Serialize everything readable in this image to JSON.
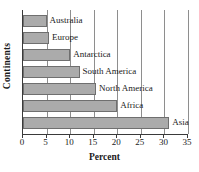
{
  "chart_data": {
    "type": "bar",
    "orientation": "horizontal",
    "title": "",
    "xlabel": "Percent",
    "ylabel": "Continents",
    "categories": [
      "Australia",
      "Europe",
      "Antarctica",
      "South America",
      "North America",
      "Africa",
      "Asia"
    ],
    "values": [
      5,
      5.5,
      10,
      12,
      15.5,
      20,
      31
    ],
    "xlim": [
      0,
      35
    ],
    "xticks": [
      0,
      5,
      10,
      15,
      20,
      25,
      30,
      35
    ],
    "xtick_labels": [
      "0",
      "5",
      "10",
      "15",
      "20",
      "25",
      "30",
      "35"
    ],
    "grid": "vertical",
    "legend": "none",
    "bar_fill": "#ababab",
    "bar_border": "#6f6f6f",
    "axis_color": "#3a3a3a",
    "grid_color": "#8e8e8e",
    "label_position": "outside-right"
  }
}
